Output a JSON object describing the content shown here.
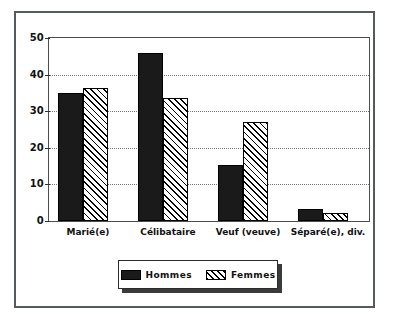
{
  "chart_data": {
    "type": "bar",
    "title": "",
    "xlabel": "",
    "ylabel": "",
    "ylim": [
      0,
      50
    ],
    "yticks": [
      0,
      10,
      20,
      30,
      40,
      50
    ],
    "ytick_labels": [
      "0",
      "10",
      "20",
      "30",
      "40",
      "50"
    ],
    "grid": true,
    "grid_axis": "y",
    "legend_position": "bottom-center",
    "categories": [
      "Marié(e)",
      "Célibataire",
      "Veuf (veuve)",
      "Séparé(e), div."
    ],
    "series": [
      {
        "name": "Hommes",
        "values": [
          35.0,
          45.8,
          15.3,
          3.3
        ],
        "style": "solid-black",
        "color": "#1a1a1a"
      },
      {
        "name": "Femmes",
        "values": [
          36.3,
          33.6,
          27.0,
          2.2
        ],
        "style": "diagonal-hatch",
        "color": "#ffffff"
      }
    ]
  },
  "legend": {
    "entries": [
      {
        "label": "Hommes"
      },
      {
        "label": "Femmes"
      }
    ]
  },
  "axes": {
    "y_tick_labels": [
      "50",
      "40",
      "30",
      "20",
      "10",
      "0"
    ],
    "x_tick_labels": [
      "Marié(e)",
      "Célibataire",
      "Veuf (veuve)",
      "Séparé(e), div."
    ]
  }
}
